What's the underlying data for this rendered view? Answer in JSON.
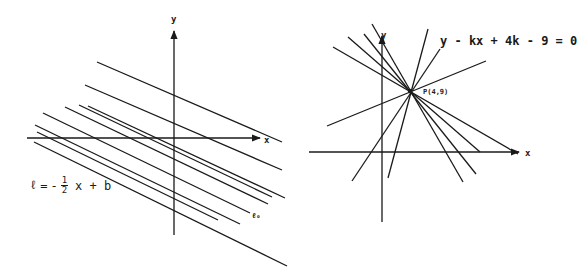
{
  "left_diagram": {
    "y_axis_label": "y",
    "x_axis_label": "x",
    "equation": {
      "lhs": "ℓ",
      "equals": "=",
      "sign": "-",
      "fraction_numerator": "1",
      "fraction_denominator": "2",
      "rest": "x + b"
    },
    "line_label": "ℓ₀",
    "line_count": 9
  },
  "right_diagram": {
    "y_axis_label": "y",
    "x_axis_label": "x",
    "equation": "y - kx + 4k - 9 = 0",
    "point_label": "P(4,9)",
    "line_count": 10
  },
  "colors": {
    "ink": "#1a1a1a",
    "background": "#ffffff"
  }
}
